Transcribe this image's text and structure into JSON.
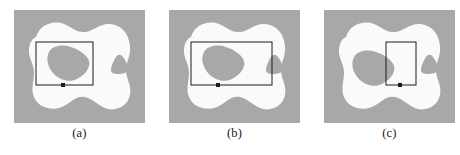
{
  "figure": {
    "type": "illustration",
    "panel_count": 3,
    "background_color": "#ffffff"
  },
  "colors": {
    "panel_background_gray": "#a8a8a8",
    "region_white": "#fafafa",
    "hole_gray": "#a8a8a8",
    "rectangle_stroke": "#1a1a1a",
    "marker_fill": "#1a1a1a",
    "caption_text": "#1a1a1a"
  },
  "panels": [
    {
      "id": "panel-a",
      "caption": "(a)",
      "rectangle": {
        "name": "window-rectangle",
        "x": 22,
        "y": 32,
        "width": 57,
        "height": 43,
        "stroke_width": 1
      },
      "marker": {
        "name": "anchor-marker",
        "x": 49,
        "y": 75
      },
      "holes": [
        {
          "name": "large-blob-hole",
          "shape": "irregular-rounded"
        },
        {
          "name": "small-triangle-hole",
          "shape": "rounded-triangle"
        }
      ]
    },
    {
      "id": "panel-b",
      "caption": "(b)",
      "rectangle": {
        "name": "window-rectangle",
        "x": 22,
        "y": 32,
        "width": 81,
        "height": 43,
        "stroke_width": 1
      },
      "marker": {
        "name": "anchor-marker",
        "x": 49,
        "y": 75
      },
      "holes": [
        {
          "name": "large-blob-hole",
          "shape": "irregular-rounded"
        },
        {
          "name": "small-triangle-hole",
          "shape": "rounded-triangle"
        }
      ]
    },
    {
      "id": "panel-c",
      "caption": "(c)",
      "rectangle": {
        "name": "window-rectangle",
        "x": 62,
        "y": 32,
        "width": 30,
        "height": 43,
        "stroke_width": 1
      },
      "marker": {
        "name": "anchor-marker",
        "x": 76,
        "y": 75
      },
      "holes": [
        {
          "name": "large-blob-hole",
          "shape": "irregular-rounded"
        },
        {
          "name": "small-triangle-hole",
          "shape": "rounded-triangle"
        }
      ]
    }
  ],
  "captions": {
    "a": "(a)",
    "b": "(b)",
    "c": "(c)"
  }
}
